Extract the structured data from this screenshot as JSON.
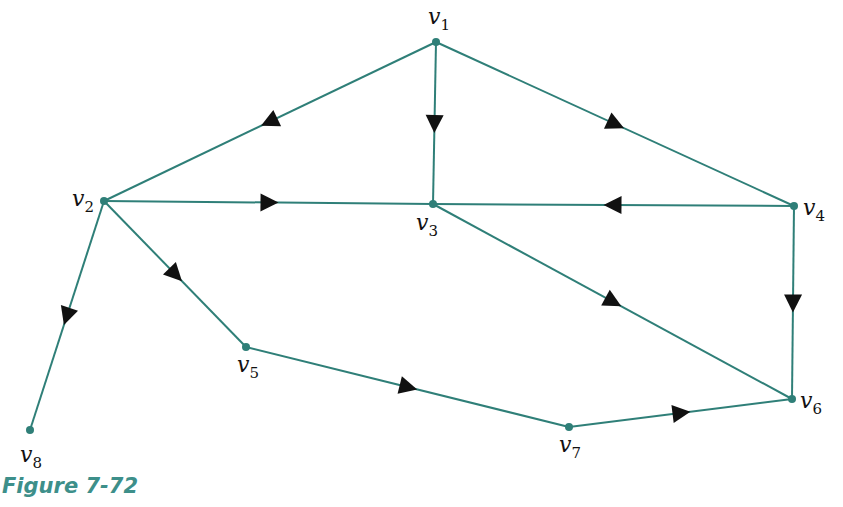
{
  "diagram": {
    "type": "directed-graph",
    "caption": "Figure 7-72",
    "colors": {
      "edge": "#2f7f78",
      "node": "#2f7f78",
      "arrow": "#111111",
      "caption": "#3d8f8a"
    },
    "nodes": [
      {
        "id": "v1",
        "base": "v",
        "sub": "1",
        "x": 436,
        "y": 42,
        "lx": 428,
        "ly": 6
      },
      {
        "id": "v2",
        "base": "v",
        "sub": "2",
        "x": 104,
        "y": 201,
        "lx": 72,
        "ly": 188
      },
      {
        "id": "v3",
        "base": "v",
        "sub": "3",
        "x": 433,
        "y": 204,
        "lx": 416,
        "ly": 212
      },
      {
        "id": "v4",
        "base": "v",
        "sub": "4",
        "x": 794,
        "y": 206,
        "lx": 803,
        "ly": 197
      },
      {
        "id": "v5",
        "base": "v",
        "sub": "5",
        "x": 246,
        "y": 347,
        "lx": 237,
        "ly": 354
      },
      {
        "id": "v6",
        "base": "v",
        "sub": "6",
        "x": 792,
        "y": 399,
        "lx": 800,
        "ly": 390
      },
      {
        "id": "v7",
        "base": "v",
        "sub": "7",
        "x": 569,
        "y": 427,
        "lx": 559,
        "ly": 434
      },
      {
        "id": "v8",
        "base": "v",
        "sub": "8",
        "x": 30,
        "y": 430,
        "lx": 20,
        "ly": 444
      }
    ],
    "edges": [
      {
        "from": "v1",
        "to": "v2"
      },
      {
        "from": "v1",
        "to": "v3"
      },
      {
        "from": "v1",
        "to": "v4"
      },
      {
        "from": "v2",
        "to": "v3"
      },
      {
        "from": "v4",
        "to": "v3"
      },
      {
        "from": "v2",
        "to": "v5"
      },
      {
        "from": "v2",
        "to": "v8"
      },
      {
        "from": "v3",
        "to": "v6"
      },
      {
        "from": "v4",
        "to": "v6"
      },
      {
        "from": "v5",
        "to": "v7"
      },
      {
        "from": "v7",
        "to": "v6"
      }
    ]
  }
}
